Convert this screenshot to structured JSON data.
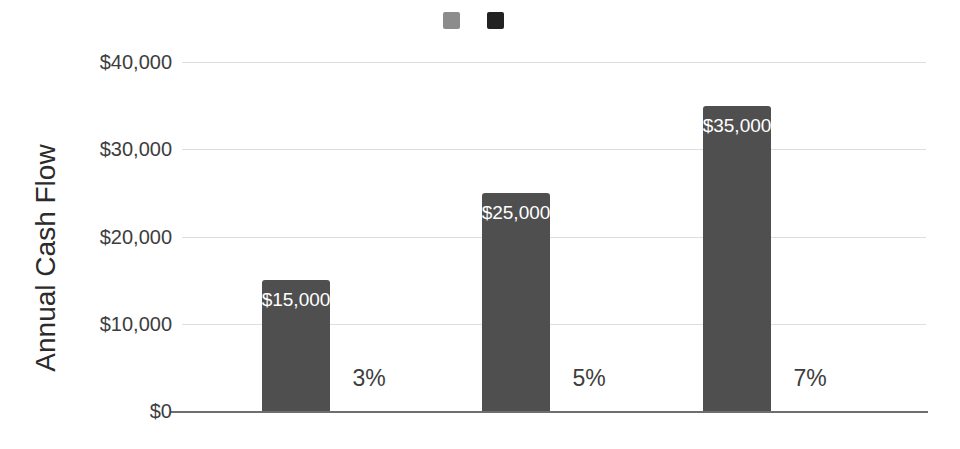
{
  "chart_data": {
    "type": "bar",
    "title": "",
    "xlabel": "",
    "ylabel": "Annual Cash Flow",
    "ylim": [
      0,
      40000
    ],
    "yticks": [
      0,
      10000,
      20000,
      30000,
      40000
    ],
    "ytick_labels": [
      "$0",
      "$10,000",
      "$20,000",
      "$30,000",
      "$40,000"
    ],
    "grid": true,
    "legend_position": "top-center",
    "categories": [
      "3%",
      "5%",
      "7%"
    ],
    "series": [
      {
        "legend_label": "",
        "color": "#4f4f4f",
        "values": [
          15000,
          25000,
          35000
        ],
        "data_labels": [
          "$15,000",
          "$25,000",
          "$35,000"
        ],
        "data_label_color": "#ffffff"
      },
      {
        "legend_label": "",
        "color": "#222222"
      }
    ]
  },
  "colors": {
    "background": "#ffffff",
    "gridline": "#dedede",
    "axis_line": "#6e6e6e",
    "tick_label": "#3d3d3d",
    "category_label": "#3d3d3d"
  }
}
